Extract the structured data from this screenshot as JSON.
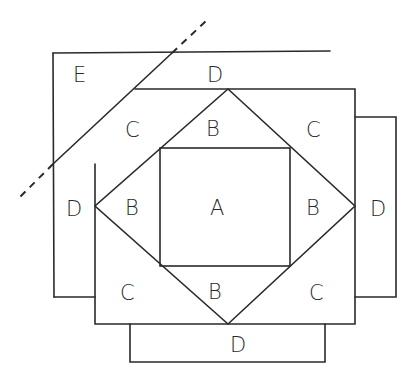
{
  "diagram": {
    "labels": {
      "A": "A",
      "B_top": "B",
      "B_left": "B",
      "B_right": "B",
      "B_bottom": "B",
      "C_top_left": "C",
      "C_top_right": "C",
      "C_bottom_left": "C",
      "C_bottom_right": "C",
      "D_top": "D",
      "D_left": "D",
      "D_right": "D",
      "D_bottom": "D",
      "E": "E"
    },
    "colors": {
      "line": "#2a2a2a",
      "background": "#ffffff"
    }
  }
}
